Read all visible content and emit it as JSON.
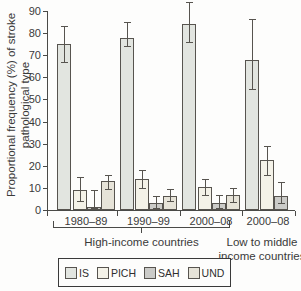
{
  "figure": {
    "y_axis_title": [
      "Proportional frequency (%) of stroke",
      "pathological type"
    ],
    "high_income_bracket_label": "High-income countries",
    "low_middle_label_line1": "Low to middle",
    "low_middle_label_line2": "income countries"
  },
  "chart_data": {
    "type": "bar",
    "title": "",
    "ylabel": "Proportional frequency (%) of stroke pathological type",
    "xlabel": "",
    "ylim": [
      0,
      90
    ],
    "ytick_step": 10,
    "grid": false,
    "error_bars": true,
    "legend_position": "bottom",
    "categories": [
      "1980–89",
      "1990–99",
      "2000–08",
      "2000–08"
    ],
    "category_groups": [
      {
        "label": "High-income countries",
        "category_indices": [
          0,
          1,
          2
        ]
      },
      {
        "label": "Low to middle income countries",
        "category_indices": [
          3
        ]
      }
    ],
    "series": [
      {
        "name": "IS",
        "color": "#e2e5e0",
        "values": [
          75,
          78,
          84,
          68
        ],
        "ci_low": [
          67,
          74,
          76,
          54.5
        ],
        "ci_high": [
          83,
          85,
          94,
          86.5
        ]
      },
      {
        "name": "PICH",
        "color": "#f4f2e8",
        "values": [
          9,
          14,
          10.5,
          22.5
        ],
        "ci_low": [
          4,
          10,
          7,
          16
        ],
        "ci_high": [
          15,
          18,
          14,
          29
        ]
      },
      {
        "name": "SAH",
        "color": "#cbcbc8",
        "values": [
          1.5,
          3,
          3,
          6.5
        ],
        "ci_low": [
          1,
          1,
          1,
          3
        ],
        "ci_high": [
          9,
          6.5,
          7,
          12.5
        ]
      },
      {
        "name": "UND",
        "color": "#e6e3d8",
        "values": [
          13,
          6.5,
          7,
          null
        ],
        "ci_low": [
          9.5,
          4,
          3.5,
          null
        ],
        "ci_high": [
          16,
          9.5,
          10,
          null
        ]
      }
    ]
  }
}
